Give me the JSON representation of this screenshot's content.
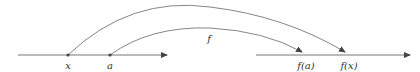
{
  "diagram": {
    "type": "function-mapping",
    "function_label": "f",
    "domain_axis": {
      "points": [
        {
          "label": "x"
        },
        {
          "label": "a"
        }
      ]
    },
    "codomain_axis": {
      "points": [
        {
          "label": "f(a)"
        },
        {
          "label": "f(x)"
        }
      ]
    },
    "mappings": [
      {
        "from": "x",
        "to": "f(x)"
      },
      {
        "from": "a",
        "to": "f(a)"
      }
    ],
    "colors": {
      "line": "#555555",
      "text": "#333333"
    }
  }
}
